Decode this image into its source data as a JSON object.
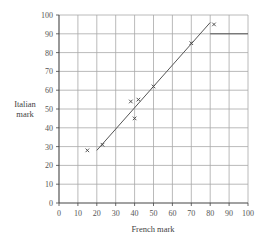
{
  "chart_data": {
    "type": "scatter",
    "title": "",
    "xlabel": "French mark",
    "ylabel": "Italian mark",
    "ylabel_lines": [
      "Italian",
      "mark"
    ],
    "xlim": [
      0,
      100
    ],
    "ylim": [
      0,
      100
    ],
    "x_ticks": [
      0,
      10,
      20,
      30,
      40,
      50,
      60,
      70,
      80,
      90,
      100
    ],
    "y_ticks": [
      0,
      10,
      20,
      30,
      40,
      50,
      60,
      70,
      80,
      90,
      100
    ],
    "grid": true,
    "legend": "none",
    "series": [
      {
        "name": "Students",
        "marker": "x",
        "points": [
          {
            "x": 15,
            "y": 28
          },
          {
            "x": 23,
            "y": 31
          },
          {
            "x": 38,
            "y": 54
          },
          {
            "x": 42,
            "y": 55
          },
          {
            "x": 40,
            "y": 45
          },
          {
            "x": 50,
            "y": 62
          },
          {
            "x": 70,
            "y": 85
          },
          {
            "x": 82,
            "y": 95
          }
        ]
      },
      {
        "name": "Line of best fit",
        "type": "line",
        "points": [
          {
            "x": 20,
            "y": 28
          },
          {
            "x": 80,
            "y": 96
          }
        ]
      },
      {
        "name": "Reference line",
        "type": "line",
        "points": [
          {
            "x": 80,
            "y": 90
          },
          {
            "x": 100,
            "y": 90
          }
        ]
      }
    ]
  },
  "colors": {
    "grid": "#a8a8a8",
    "axis": "#444444",
    "line": "#555555",
    "marker": "#444444"
  }
}
